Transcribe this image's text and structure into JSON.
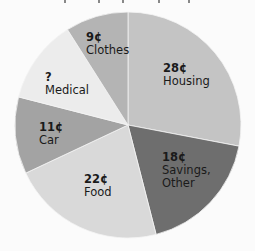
{
  "chart_data": {
    "type": "pie",
    "title": "",
    "unit": "¢",
    "start_angle_deg": 0,
    "direction": "clockwise",
    "slices": [
      {
        "label": "Housing",
        "value": 28,
        "display": "28¢",
        "color": "#c4c4c4",
        "lines": [
          "28¢",
          "Housing"
        ]
      },
      {
        "label": "Savings, Other",
        "value": 18,
        "display": "18¢",
        "color": "#6e6e6e",
        "lines": [
          "18¢",
          "Savings,",
          "Other"
        ]
      },
      {
        "label": "Food",
        "value": 22,
        "display": "22¢",
        "color": "#d9d9d9",
        "lines": [
          "22¢",
          "Food"
        ]
      },
      {
        "label": "Car",
        "value": 11,
        "display": "11¢",
        "color": "#a3a3a3",
        "lines": [
          "11¢",
          "Car"
        ]
      },
      {
        "label": "Medical",
        "value": 12,
        "display": "?",
        "color": "#ececec",
        "lines": [
          "?",
          "Medical"
        ]
      },
      {
        "label": "Clothes",
        "value": 9,
        "display": "9¢",
        "color": "#b4b4b4",
        "lines": [
          "9¢",
          "Clothes"
        ]
      }
    ],
    "total": 100,
    "legend": "none (labels inside slices)"
  },
  "labels": {
    "housing": {
      "value": "28¢",
      "name": "Housing"
    },
    "savings": {
      "value": "18¢",
      "name1": "Savings,",
      "name2": "Other"
    },
    "food": {
      "value": "22¢",
      "name": "Food"
    },
    "car": {
      "value": "11¢",
      "name": "Car"
    },
    "medical": {
      "value": "?",
      "name": "Medical"
    },
    "clothes": {
      "value": "9¢",
      "name": "Clothes"
    }
  }
}
